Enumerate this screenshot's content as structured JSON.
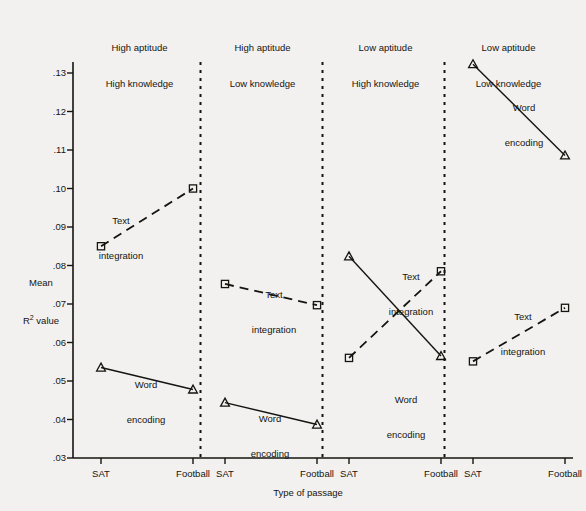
{
  "chart_data": {
    "type": "line",
    "title": "",
    "xlabel": "Type of passage",
    "ylabel_line1": "Mean",
    "ylabel_line2": "R² value",
    "ylim": [
      0.03,
      0.135
    ],
    "yticks": [
      ".03",
      ".04",
      ".05",
      ".06",
      ".07",
      ".08",
      ".09",
      ".10",
      ".11",
      ".12",
      ".13"
    ],
    "ytick_values": [
      0.03,
      0.04,
      0.05,
      0.06,
      0.07,
      0.08,
      0.09,
      0.1,
      0.11,
      0.12,
      0.13
    ],
    "categories": [
      "SAT",
      "Football"
    ],
    "grid": false,
    "legend": "inline-annotations",
    "panels": [
      {
        "header_line1": "High aptitude",
        "header_line2": "High knowledge",
        "xticks": [
          "SAT",
          "Football"
        ],
        "series": [
          {
            "name": "Text integration",
            "style": "dashed",
            "marker": "square",
            "values": [
              0.085,
              0.1
            ],
            "label_line1": "Text",
            "label_line2": "integration"
          },
          {
            "name": "Word encoding",
            "style": "solid",
            "marker": "triangle",
            "values": [
              0.0535,
              0.0478
            ],
            "label_line1": "Word",
            "label_line2": "encoding"
          }
        ]
      },
      {
        "header_line1": "High aptitude",
        "header_line2": "Low knowledge",
        "xticks": [
          "SAT",
          "Football"
        ],
        "series": [
          {
            "name": "Text integration",
            "style": "dashed",
            "marker": "square",
            "values": [
              0.0752,
              0.0697
            ],
            "label_line1": "Text",
            "label_line2": "integration"
          },
          {
            "name": "Word encoding",
            "style": "solid",
            "marker": "triangle",
            "values": [
              0.0444,
              0.0387
            ],
            "label_line1": "Word",
            "label_line2": "encoding"
          }
        ]
      },
      {
        "header_line1": "Low aptitude",
        "header_line2": "High knowledge",
        "xticks": [
          "SAT",
          "Football"
        ],
        "series": [
          {
            "name": "Text integration",
            "style": "dashed",
            "marker": "square",
            "values": [
              0.056,
              0.0785
            ],
            "label_line1": "Text",
            "label_line2": "integration"
          },
          {
            "name": "Word encoding",
            "style": "solid",
            "marker": "triangle",
            "values": [
              0.0824,
              0.0565
            ],
            "label_line1": "Word",
            "label_line2": "encoding"
          }
        ]
      },
      {
        "header_line1": "Low aptitude",
        "header_line2": "Low knowledge",
        "xticks": [
          "SAT",
          "Football"
        ],
        "series": [
          {
            "name": "Text integration",
            "style": "dashed",
            "marker": "square",
            "values": [
              0.0551,
              0.069
            ],
            "label_line1": "Text",
            "label_line2": "integration"
          },
          {
            "name": "Word encoding",
            "style": "solid",
            "marker": "triangle",
            "values": [
              0.1323,
              0.1086
            ],
            "label_line1": "Word",
            "label_line2": "encoding"
          }
        ]
      }
    ],
    "colors": {
      "ink": "#15140f",
      "background": "#f2f1ef"
    }
  },
  "annotations": {
    "panel1_text_label": {
      "line1": "Text",
      "line2": "integration"
    },
    "panel1_word_label": {
      "line1": "Word",
      "line2": "encoding"
    },
    "panel2_text_label": {
      "line1": "Text",
      "line2": "integration"
    },
    "panel2_word_label": {
      "line1": "Word",
      "line2": "encoding"
    },
    "panel3_text_label": {
      "line1": "Text",
      "line2": "integration"
    },
    "panel3_word_label": {
      "line1": "Word",
      "line2": "encoding"
    },
    "panel4_text_label": {
      "line1": "Word",
      "line2": "encoding"
    },
    "panel4_text_label2": {
      "line1": "Text",
      "line2": "integration"
    }
  }
}
